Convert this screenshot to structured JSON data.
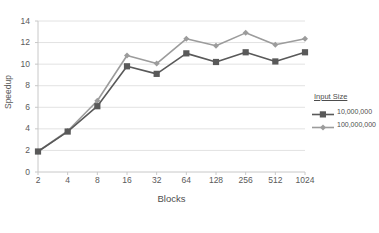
{
  "chart_data": {
    "type": "line",
    "title": "",
    "xlabel": "Blocks",
    "ylabel": "Speedup",
    "categories": [
      "2",
      "4",
      "8",
      "16",
      "32",
      "64",
      "128",
      "256",
      "512",
      "1024"
    ],
    "x_tick_labels": [
      "2",
      "4",
      "8",
      "16",
      "32",
      "64",
      "128",
      "256",
      "512",
      "1024"
    ],
    "y_tick_labels": [
      "0",
      "2",
      "4",
      "6",
      "8",
      "10",
      "12",
      "14"
    ],
    "y_ticks": [
      0,
      2,
      4,
      6,
      8,
      10,
      12,
      14
    ],
    "ylim": [
      0,
      14
    ],
    "grid": "horizontal",
    "legend_position": "right",
    "legend_title": "Input Size",
    "series": [
      {
        "name": "10,000,000",
        "color": "#595959",
        "marker": "square",
        "values": [
          1.9,
          3.75,
          6.1,
          9.8,
          9.1,
          11.0,
          10.2,
          11.1,
          10.25,
          11.1
        ]
      },
      {
        "name": "100,000,000",
        "color": "#9c9c9c",
        "marker": "diamond",
        "values": [
          1.9,
          3.8,
          6.6,
          10.8,
          10.05,
          12.35,
          11.7,
          12.9,
          11.8,
          12.35
        ]
      }
    ]
  },
  "axis": {
    "line_color": "#c8c8c8",
    "grid_color": "#e2e2e2"
  }
}
